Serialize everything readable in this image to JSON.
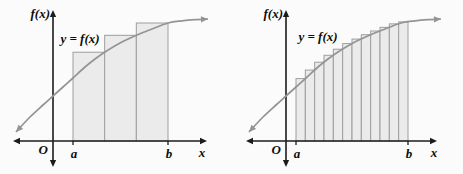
{
  "figure": {
    "background": "#fbfbfb"
  },
  "colors": {
    "axis": "#1c1c1c",
    "curve": "#949494",
    "rect_fill": "#ebebeb",
    "rect_stroke": "#9e9e9e",
    "label": "#0d0d0d"
  },
  "panels": [
    {
      "id": "coarse-partition",
      "num_rectangles": 3,
      "labels": {
        "y_axis": "f(x)",
        "curve": "y = f(x)",
        "origin": "O",
        "a": "a",
        "b": "b",
        "x_axis": "x"
      },
      "geometry": {
        "width": 231,
        "height": 174,
        "y_axis_x": 53,
        "x_axis_y": 141,
        "y_axis_top": 10,
        "y_axis_bottom": 167,
        "x_axis_left": 13,
        "x_axis_right": 207,
        "a_x": 73,
        "b_x": 168,
        "curve_label_pos": [
          80,
          43
        ],
        "f_label_end": [
          50,
          18
        ],
        "o_label_pos": [
          48,
          154
        ],
        "ab_label_y": 158,
        "x_label_pos": [
          202,
          157
        ],
        "curve_anchors": [
          [
            16,
            132
          ],
          [
            30,
            117
          ],
          [
            43,
            105
          ],
          [
            53,
            96
          ],
          [
            63,
            87
          ],
          [
            73,
            78
          ],
          [
            85,
            67
          ],
          [
            95,
            59
          ],
          [
            105,
            52
          ],
          [
            120,
            43
          ],
          [
            137,
            35
          ],
          [
            152,
            29
          ],
          [
            168,
            23
          ],
          [
            182,
            20.8
          ],
          [
            195,
            19.6
          ],
          [
            208,
            19
          ]
        ]
      }
    },
    {
      "id": "fine-partition",
      "num_rectangles": 12,
      "labels": {
        "y_axis": "f(x)",
        "curve": "y = f(x)",
        "origin": "O",
        "a": "a",
        "b": "b",
        "x_axis": "x"
      },
      "geometry": {
        "width": 232,
        "height": 174,
        "y_axis_x": 55,
        "x_axis_y": 141,
        "y_axis_top": 10,
        "y_axis_bottom": 167,
        "x_axis_left": 15,
        "x_axis_right": 206,
        "a_x": 65,
        "b_x": 177,
        "curve_label_pos": [
          87,
          41
        ],
        "f_label_end": [
          52,
          18
        ],
        "o_label_pos": [
          50,
          154
        ],
        "ab_label_y": 158,
        "x_label_pos": [
          203,
          157
        ],
        "curve_anchors": [
          [
            18,
            132
          ],
          [
            32,
            117
          ],
          [
            45,
            105
          ],
          [
            55,
            96
          ],
          [
            65,
            87
          ],
          [
            75,
            78
          ],
          [
            87,
            67
          ],
          [
            97,
            59
          ],
          [
            107,
            52
          ],
          [
            122,
            43
          ],
          [
            139,
            35
          ],
          [
            154,
            29
          ],
          [
            170,
            23
          ],
          [
            184,
            20.8
          ],
          [
            197,
            19.6
          ],
          [
            210,
            19
          ]
        ]
      }
    }
  ]
}
